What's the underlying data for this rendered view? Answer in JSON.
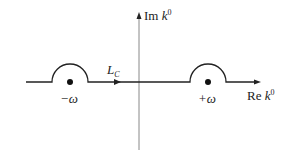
{
  "diagram": {
    "axes": {
      "imaginary": {
        "label_prefix": "Im ",
        "label_var": "k",
        "label_sup": "0"
      },
      "real": {
        "label_prefix": "Re ",
        "label_var": "k",
        "label_sup": "0"
      }
    },
    "contour": {
      "label_main": "L",
      "label_sub": "C"
    },
    "poles": [
      {
        "label": "−ω",
        "x": 70
      },
      {
        "label": "+ω",
        "x": 208
      }
    ],
    "colors": {
      "line": "#222222",
      "axis": "#888888"
    }
  }
}
